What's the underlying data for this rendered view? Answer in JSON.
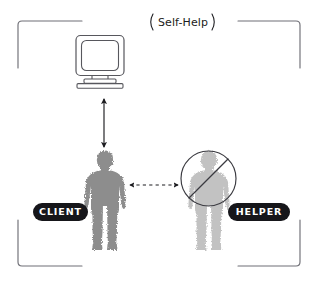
{
  "diagram": {
    "title": "Self-Help",
    "frame": {
      "style": "corner-brackets",
      "color": "#6f6f76"
    },
    "nodes": [
      {
        "id": "computer",
        "icon": "computer-monitor-icon",
        "label": ""
      },
      {
        "id": "client",
        "icon": "person-silhouette-icon",
        "label": "CLIENT",
        "color": "#8d8d8d",
        "blocked": false
      },
      {
        "id": "helper",
        "icon": "person-silhouette-icon",
        "label": "HELPER",
        "color": "#c2c2c2",
        "blocked": true,
        "blocked_marker": "prohibition-circle-slash-icon"
      }
    ],
    "connectors": [
      {
        "id": "client-computer",
        "from": "client",
        "to": "computer",
        "style": "solid",
        "arrows": "double",
        "orientation": "vertical"
      },
      {
        "id": "client-helper",
        "from": "client",
        "to": "helper",
        "style": "dashed",
        "arrows": "double",
        "orientation": "horizontal"
      }
    ],
    "colors": {
      "ink": "#1c1c20",
      "badge_background": "#16161a",
      "badge_text": "#ffffff",
      "client_figure": "#8d8d8d",
      "helper_figure": "#c2c2c2",
      "frame_line": "#6f6f76",
      "monitor_line": "#57575d"
    }
  }
}
